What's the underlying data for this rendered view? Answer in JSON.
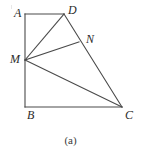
{
  "figure": {
    "caption": "(a)",
    "stroke_color": "#4a4a4a",
    "background_color": "#ffffff",
    "label_color": "#2b2b2b",
    "stroke_width": 1,
    "points": {
      "A": {
        "label": "A",
        "x": 25,
        "y": 14,
        "label_x": 14,
        "label_y": 13
      },
      "D": {
        "label": "D",
        "x": 64,
        "y": 14,
        "label_x": 68,
        "label_y": 10
      },
      "M": {
        "label": "M",
        "x": 25,
        "y": 60,
        "label_x": 11,
        "label_y": 55
      },
      "N": {
        "label": "N",
        "x": 79,
        "y": 42,
        "label_x": 86,
        "label_y": 35
      },
      "B": {
        "label": "B",
        "x": 25,
        "y": 107,
        "label_x": 27,
        "label_y": 112
      },
      "C": {
        "label": "C",
        "x": 122,
        "y": 107,
        "label_x": 125,
        "label_y": 112
      }
    },
    "segments": [
      {
        "name": "AD",
        "from": "A",
        "to": "D"
      },
      {
        "name": "AB",
        "from": "A",
        "to": "B"
      },
      {
        "name": "BC",
        "from": "B",
        "to": "C"
      },
      {
        "name": "DC",
        "from": "D",
        "to": "C"
      },
      {
        "name": "MD",
        "from": "M",
        "to": "D"
      },
      {
        "name": "MN",
        "from": "M",
        "to": "N"
      },
      {
        "name": "MC",
        "from": "M",
        "to": "C"
      }
    ]
  }
}
